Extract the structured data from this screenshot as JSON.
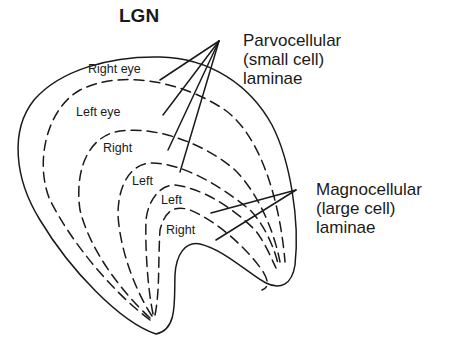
{
  "title": "LGN",
  "layers": [
    {
      "label": "Right eye",
      "x": 88,
      "y": 63
    },
    {
      "label": "Left eye",
      "x": 76,
      "y": 106
    },
    {
      "label": "Right",
      "x": 103,
      "y": 142
    },
    {
      "label": "Left",
      "x": 132,
      "y": 175
    },
    {
      "label": "Left",
      "x": 161,
      "y": 194
    },
    {
      "label": "Right",
      "x": 166,
      "y": 224
    }
  ],
  "callouts": {
    "parvocellular": {
      "lines": [
        "Parvocellular",
        "(small cell)",
        "laminae"
      ]
    },
    "magnocellular": {
      "lines": [
        "Magnocellular",
        "(large cell)",
        "laminae"
      ]
    }
  },
  "colors": {
    "ink": "#1a1a1a",
    "background": "#ffffff"
  }
}
